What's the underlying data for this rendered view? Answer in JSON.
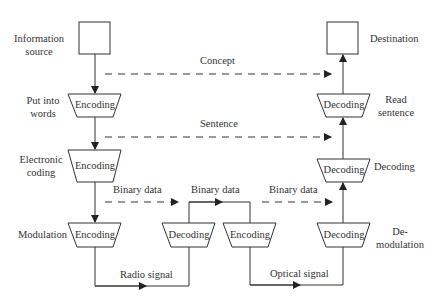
{
  "diagram": {
    "type": "communication-coding-flow",
    "stroke_color": "#333333",
    "left_labels": {
      "source": [
        "Information",
        "source"
      ],
      "put_into_words": [
        "Put into",
        "words"
      ],
      "electronic_coding": [
        "Electronic",
        "coding"
      ],
      "modulation": "Modulation"
    },
    "right_labels": {
      "destination": "Destination",
      "read_sentence": [
        "Read",
        "sentence"
      ],
      "decoding": "Decoding",
      "demodulation": [
        "De-",
        "modulation"
      ]
    },
    "nodes": {
      "enc1": "Encoding",
      "enc2": "Encoding",
      "enc3": "Encoding",
      "mid_dec": "Decoding",
      "mid_enc": "Encoding",
      "dec1": "Decoding",
      "dec2": "Decoding",
      "dec3": "Decoding"
    },
    "edge_labels": {
      "concept": "Concept",
      "sentence": "Sentence",
      "binary1": "Binary data",
      "binary2": "Binary data",
      "binary3": "Binary data",
      "radio": "Radio signal",
      "optical": "Optical signal"
    }
  }
}
